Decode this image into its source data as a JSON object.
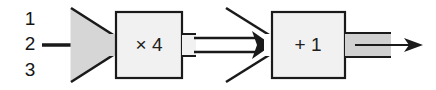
{
  "diagram": {
    "canvas": {
      "width": 436,
      "height": 90,
      "background": "#ffffff"
    },
    "colors": {
      "stroke": "#1a1a1a",
      "funnel_fill": "#d6d6d6",
      "block_fill": "#f1f1f1",
      "stub_fill": "#d0d0d0",
      "text": "#1a1a1a"
    },
    "inputs": {
      "name": "input-channels",
      "labels": [
        "1",
        "2",
        "3"
      ],
      "positions_y": [
        20,
        45,
        71
      ]
    },
    "arrows": {
      "input_arrow": {
        "name": "input-arrow",
        "style": "single-line",
        "from_x": 40,
        "to_x": 112,
        "y": 45
      },
      "mid_arrow": {
        "name": "mid-arrow",
        "style": "double-line",
        "from_x": 182,
        "to_x": 268,
        "y": 45
      },
      "output_arrow": {
        "name": "output-arrow",
        "style": "single-line",
        "from_x": 350,
        "to_x": 422,
        "y": 45
      }
    },
    "nodes": [
      {
        "name": "fan-in-funnel-filled",
        "type": "funnel",
        "fill": "filled-gray",
        "label": ""
      },
      {
        "name": "gain-block",
        "type": "block",
        "label": "× 4",
        "x": 116,
        "y": 12,
        "width": 66,
        "height": 66
      },
      {
        "name": "fan-in-funnel-open",
        "type": "funnel",
        "fill": "none",
        "label": ""
      },
      {
        "name": "offset-block",
        "type": "block",
        "label": "+ 1",
        "x": 272,
        "y": 12,
        "width": 73,
        "height": 66
      }
    ],
    "output_stub": {
      "name": "output-stub",
      "fill": "#d0d0d0"
    }
  }
}
